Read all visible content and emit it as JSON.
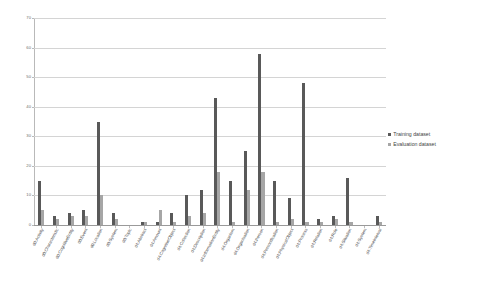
{
  "chart_data": {
    "type": "bar",
    "title": "",
    "subtitle": "",
    "xlabel": "",
    "ylabel": "",
    "ylim": [
      0,
      70
    ],
    "ytick_values": [
      0,
      10,
      20,
      30,
      40,
      50,
      60,
      70
    ],
    "ytick_labels": [
      "0",
      "10",
      "20",
      "30",
      "40",
      "50",
      "60",
      "70"
    ],
    "grid": true,
    "legend_position": "right",
    "categories": [
      "d0:Activity",
      "d0:Characteristic",
      "d0:CognitiveEntity",
      "d0:Event",
      "d0:Location",
      "d0:System",
      "d0:Topic",
      "d4:Abstract",
      "d4:Amount",
      "d4:CognitiveObject",
      "d4:Collection",
      "d4:Description",
      "d4:InformationEntity",
      "d4:Organism",
      "d4:Organisation",
      "d4:Person",
      "d4:Personification",
      "d4:PhysicalObject",
      "d4:Process",
      "d4:Relation",
      "d4:Role",
      "d4:Situation",
      "d4:System",
      "d4:TimeInterval"
    ],
    "series": [
      {
        "name": "Training dataset",
        "color": "#595959",
        "values": [
          15,
          3,
          4,
          5,
          35,
          4,
          0,
          1,
          1,
          4,
          10,
          12,
          43,
          15,
          25,
          58,
          15,
          9,
          48,
          2,
          3,
          16,
          0,
          3
        ]
      },
      {
        "name": "Evaluation dataset",
        "color": "#a6a6a6",
        "values": [
          5,
          2,
          3,
          3,
          10,
          2,
          0,
          1,
          5,
          1,
          3,
          4,
          18,
          1,
          12,
          18,
          1,
          2,
          1,
          1,
          2,
          1,
          0,
          1
        ]
      }
    ]
  },
  "legend": {
    "items": [
      {
        "label": "Training dataset",
        "swatch": "training"
      },
      {
        "label": "Evaluation dataset",
        "swatch": "evaluation"
      }
    ]
  }
}
